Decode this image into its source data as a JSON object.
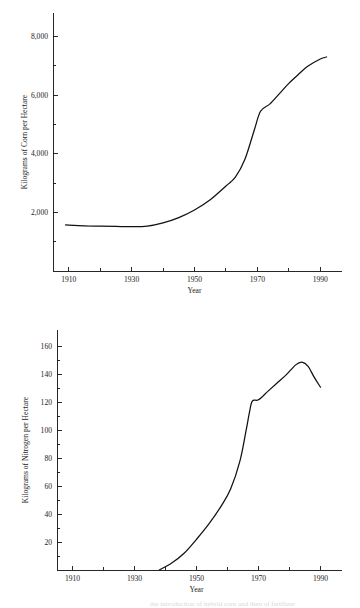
{
  "page": {
    "background": "#ffffff",
    "ink": "#111111",
    "partial_footer_text": "the introduction of hybrid corn and then of fertilizer"
  },
  "chart_data": [
    {
      "id": "corn",
      "type": "line",
      "title": "",
      "xlabel": "Year",
      "ylabel": "Kilograms of Corn per Hectare",
      "xlim": [
        1905,
        1995
      ],
      "ylim": [
        0,
        8800
      ],
      "grid": false,
      "legend": null,
      "x_major_ticks": [
        1910,
        1930,
        1950,
        1970,
        1990
      ],
      "x_major_tick_labels": [
        "1910",
        "1930",
        "1950",
        "1970",
        "1990"
      ],
      "x_minor_ticks": [
        1920,
        1940,
        1960,
        1980
      ],
      "y_major_ticks": [
        2000,
        4000,
        6000,
        8000
      ],
      "y_major_tick_labels": [
        "2,000",
        "4,000",
        "6,000",
        "8,000"
      ],
      "y_minor_ticks": [
        1000,
        3000,
        5000,
        7000
      ],
      "x": [
        1909,
        1915,
        1920,
        1925,
        1930,
        1935,
        1940,
        1945,
        1950,
        1955,
        1960,
        1963,
        1966,
        1969,
        1971,
        1974,
        1977,
        1980,
        1983,
        1986,
        1990,
        1992
      ],
      "values": [
        1570,
        1540,
        1530,
        1520,
        1510,
        1530,
        1640,
        1820,
        2080,
        2430,
        2900,
        3200,
        3800,
        4800,
        5450,
        5700,
        6050,
        6400,
        6700,
        6980,
        7230,
        7300
      ],
      "series": [
        {
          "name": "Corn yield",
          "values": [
            1570,
            1540,
            1530,
            1520,
            1510,
            1530,
            1640,
            1820,
            2080,
            2430,
            2900,
            3200,
            3800,
            4800,
            5450,
            5700,
            6050,
            6400,
            6700,
            6980,
            7230,
            7300
          ]
        }
      ]
    },
    {
      "id": "nitrogen",
      "type": "line",
      "title": "",
      "xlabel": "Year",
      "ylabel": "Kilograms of Nitrogen per Hectare",
      "xlim": [
        1905,
        1995
      ],
      "ylim": [
        0,
        172
      ],
      "grid": false,
      "legend": null,
      "x_major_ticks": [
        1910,
        1930,
        1950,
        1970,
        1990
      ],
      "x_major_tick_labels": [
        "1910",
        "1930",
        "1950",
        "1970",
        "1990"
      ],
      "x_minor_ticks": [
        1920,
        1940,
        1960,
        1980
      ],
      "y_major_ticks": [
        20,
        40,
        60,
        80,
        100,
        120,
        140,
        160
      ],
      "y_major_tick_labels": [
        "20",
        "40",
        "60",
        "80",
        "100",
        "120",
        "140",
        "160"
      ],
      "y_minor_ticks": [
        10,
        30,
        50,
        70,
        90,
        110,
        130,
        150
      ],
      "x": [
        1938,
        1942,
        1946,
        1950,
        1954,
        1958,
        1961,
        1964,
        1966,
        1967,
        1968,
        1970,
        1973,
        1976,
        1979,
        1982,
        1984,
        1986,
        1988,
        1990
      ],
      "values": [
        0,
        5,
        12,
        22,
        33,
        46,
        58,
        78,
        100,
        112,
        121,
        122,
        128,
        134,
        140,
        147,
        149,
        146,
        138,
        131
      ],
      "series": [
        {
          "name": "Nitrogen applied",
          "values": [
            0,
            5,
            12,
            22,
            33,
            46,
            58,
            78,
            100,
            112,
            121,
            122,
            128,
            134,
            140,
            147,
            149,
            146,
            138,
            131
          ]
        }
      ]
    }
  ]
}
